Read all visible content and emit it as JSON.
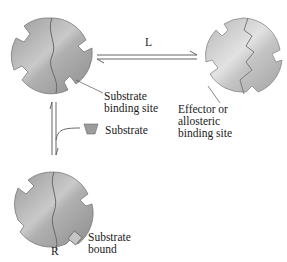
{
  "diagram": {
    "arrow_label_top": "L",
    "arrow_label_bottom": "R",
    "labels": {
      "substrate_binding_site": [
        "Substrate",
        "binding site"
      ],
      "effector_site": [
        "Effector or",
        "allosteric",
        "binding site"
      ],
      "substrate": "Substrate",
      "substrate_bound": [
        "Substrate",
        "bound"
      ]
    },
    "colors": {
      "enzyme_fill": "#a8a8a8",
      "enzyme_highlight": "#d4d4d4",
      "enzyme_light_fill": "#c8c8c8",
      "outline": "#6e6e6e",
      "arrow": "#555555"
    },
    "states": [
      {
        "name": "T-state enzyme (top-left)"
      },
      {
        "name": "R-state enzyme with effector site (top-right)"
      },
      {
        "name": "R-state enzyme with substrate bound (bottom-left)"
      }
    ]
  }
}
